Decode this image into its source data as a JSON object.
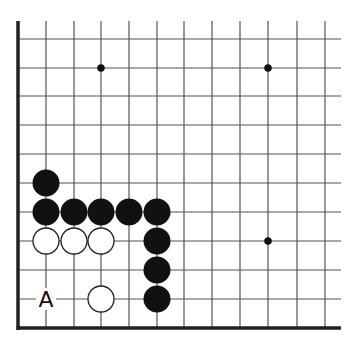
{
  "diagram": {
    "type": "go-board-corner",
    "grid": {
      "x_lines": [
        46,
        74,
        101,
        129,
        157,
        184,
        212,
        240,
        268,
        297,
        325
      ],
      "y_lines": [
        39,
        68,
        96,
        125,
        154,
        183,
        212,
        241,
        270,
        299
      ],
      "left_edge_x": 18,
      "bottom_edge_y": 328,
      "top_y": 21,
      "right_x": 341,
      "line_color": "#555555",
      "edge_color": "#222222"
    },
    "star_points": [
      {
        "x": 101,
        "y": 68
      },
      {
        "x": 268,
        "y": 68
      },
      {
        "x": 268,
        "y": 241
      }
    ],
    "black_stones": [
      {
        "x": 46,
        "y": 183
      },
      {
        "x": 46,
        "y": 212
      },
      {
        "x": 74,
        "y": 212
      },
      {
        "x": 101,
        "y": 212
      },
      {
        "x": 129,
        "y": 212
      },
      {
        "x": 157,
        "y": 212
      },
      {
        "x": 157,
        "y": 241
      },
      {
        "x": 157,
        "y": 270
      },
      {
        "x": 157,
        "y": 299
      }
    ],
    "white_stones": [
      {
        "x": 46,
        "y": 241
      },
      {
        "x": 74,
        "y": 241
      },
      {
        "x": 101,
        "y": 241
      },
      {
        "x": 101,
        "y": 299
      }
    ],
    "labels": [
      {
        "x": 46,
        "y": 299,
        "text": "A"
      }
    ],
    "stone_radius": 13.5,
    "colors": {
      "black": "#111111",
      "white": "#ffffff",
      "stone_outline": "#222222"
    }
  }
}
